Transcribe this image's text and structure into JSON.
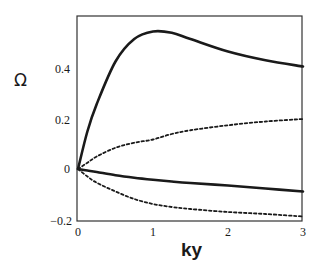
{
  "chart_data": {
    "type": "line",
    "title": "",
    "xlabel": "ky",
    "ylabel": "Ω",
    "xlim": [
      0,
      3
    ],
    "ylim": [
      -0.2,
      0.6
    ],
    "grid": false,
    "legend": null,
    "x_ticks": [
      "0",
      "1",
      "2",
      "3"
    ],
    "y_ticks": [
      "-0.2",
      "0",
      "0.2",
      "0.4"
    ],
    "x": [
      0,
      0.125,
      0.25,
      0.5,
      0.75,
      1.0,
      1.25,
      1.5,
      2.0,
      2.5,
      3.0
    ],
    "series": [
      {
        "name": "upper-solid",
        "style": "solid",
        "width": 2.6,
        "values": [
          0,
          0.15,
          0.26,
          0.43,
          0.52,
          0.55,
          0.545,
          0.52,
          0.47,
          0.435,
          0.41
        ]
      },
      {
        "name": "upper-dotted",
        "style": "dotted",
        "width": 1.8,
        "values": [
          0,
          0.025,
          0.05,
          0.085,
          0.105,
          0.118,
          0.14,
          0.155,
          0.175,
          0.19,
          0.2
        ]
      },
      {
        "name": "lower-solid",
        "style": "solid",
        "width": 2.6,
        "values": [
          0,
          -0.006,
          -0.012,
          -0.025,
          -0.035,
          -0.043,
          -0.05,
          -0.056,
          -0.066,
          -0.078,
          -0.09
        ]
      },
      {
        "name": "lower-dotted",
        "style": "dotted",
        "width": 1.8,
        "values": [
          0,
          -0.03,
          -0.055,
          -0.09,
          -0.12,
          -0.14,
          -0.152,
          -0.16,
          -0.172,
          -0.18,
          -0.19
        ]
      }
    ]
  },
  "axes": {
    "ylabel": "Ω",
    "xlabel": "ky",
    "x_ticks": [
      "0",
      "1",
      "2",
      "3"
    ],
    "y_ticks": [
      "0.4",
      "0.2",
      "0",
      "−0.2"
    ]
  }
}
